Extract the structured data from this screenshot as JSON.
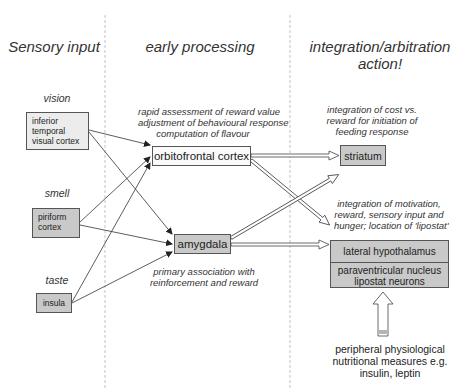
{
  "columns": [
    {
      "header": "Sensory input"
    },
    {
      "header": "early processing"
    },
    {
      "header": "integration/arbitration",
      "header_line2": "action!"
    }
  ],
  "sensory": {
    "vision": {
      "label": "vision",
      "box": [
        "inferior",
        "temporal",
        "visual cortex"
      ]
    },
    "smell": {
      "label": "smell",
      "box": [
        "piriform",
        "cortex"
      ]
    },
    "taste": {
      "label": "taste",
      "box": [
        "insula"
      ]
    }
  },
  "early": {
    "ofc": {
      "label": "orbitofrontal cortex",
      "notes": [
        "rapid assessment of reward value",
        "adjustment of behavioural response",
        "computation of flavour"
      ]
    },
    "amygdala": {
      "label": "amygdala",
      "notes": [
        "primary association with",
        "reinforcement and reward"
      ]
    }
  },
  "integration": {
    "striatum": {
      "label": "striatum",
      "notes": [
        "integration of cost vs.",
        "reward for initiation of",
        "feeding response"
      ]
    },
    "hypothalamus": {
      "notes": [
        "integration of motivation,",
        "reward, sensory input and",
        "hunger; location of 'lipostat'"
      ],
      "lateral": "lateral hypothalamus",
      "pvn_line1": "paraventricular nucleus",
      "pvn_line2": "lipostat neurons"
    },
    "peripheral": [
      "peripheral physiological",
      "nutritional measures e.g.",
      "insulin, leptin"
    ]
  },
  "colors": {
    "light_box": "#ececec",
    "mid_box": "#c9c9c9",
    "divider": "#bbbbbb",
    "line": "#333333"
  }
}
